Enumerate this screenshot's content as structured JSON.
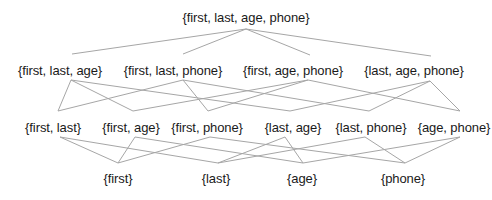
{
  "diagram": {
    "type": "hasse-diagram",
    "title": "",
    "levels": [
      {
        "name": "level-4",
        "nodes": [
          {
            "id": "flap",
            "label": "{first, last, age, phone}",
            "x": 246,
            "y": 10
          }
        ]
      },
      {
        "name": "level-3",
        "nodes": [
          {
            "id": "fla",
            "label": "{first, last, age}",
            "x": 60,
            "y": 63
          },
          {
            "id": "flp",
            "label": "{first, last, phone}",
            "x": 173,
            "y": 63
          },
          {
            "id": "fap",
            "label": "{first, age, phone}",
            "x": 293,
            "y": 63
          },
          {
            "id": "lap",
            "label": "{last, age, phone}",
            "x": 414,
            "y": 63
          }
        ]
      },
      {
        "name": "level-2",
        "nodes": [
          {
            "id": "fl",
            "label": "{first, last}",
            "x": 53,
            "y": 120
          },
          {
            "id": "fa",
            "label": "{first, age}",
            "x": 131,
            "y": 120
          },
          {
            "id": "fp",
            "label": "{first, phone}",
            "x": 207,
            "y": 120
          },
          {
            "id": "la",
            "label": "{last, age}",
            "x": 293,
            "y": 120
          },
          {
            "id": "lp",
            "label": "{last, phone}",
            "x": 371,
            "y": 120
          },
          {
            "id": "ap",
            "label": "{age, phone}",
            "x": 454,
            "y": 120
          }
        ]
      },
      {
        "name": "level-1",
        "nodes": [
          {
            "id": "f",
            "label": "{first}",
            "x": 118,
            "y": 171
          },
          {
            "id": "l",
            "label": "{last}",
            "x": 216,
            "y": 171
          },
          {
            "id": "a",
            "label": "{age}",
            "x": 302,
            "y": 171
          },
          {
            "id": "p",
            "label": "{phone}",
            "x": 403,
            "y": 171
          }
        ]
      }
    ],
    "edges": [
      {
        "from": "flap",
        "to": "fla",
        "x1": 246,
        "y1": 29,
        "x2": 72,
        "y2": 54
      },
      {
        "from": "flap",
        "to": "flp",
        "x1": 246,
        "y1": 29,
        "x2": 183,
        "y2": 54
      },
      {
        "from": "flap",
        "to": "fap",
        "x1": 246,
        "y1": 29,
        "x2": 310,
        "y2": 55
      },
      {
        "from": "flap",
        "to": "lap",
        "x1": 246,
        "y1": 29,
        "x2": 431,
        "y2": 56
      },
      {
        "from": "fla",
        "to": "fl",
        "x1": 71,
        "y1": 80,
        "x2": 58,
        "y2": 111
      },
      {
        "from": "fla",
        "to": "fa",
        "x1": 71,
        "y1": 80,
        "x2": 133,
        "y2": 111
      },
      {
        "from": "fla",
        "to": "la",
        "x1": 71,
        "y1": 80,
        "x2": 290,
        "y2": 111
      },
      {
        "from": "flp",
        "to": "fl",
        "x1": 183,
        "y1": 80,
        "x2": 58,
        "y2": 111
      },
      {
        "from": "flp",
        "to": "fp",
        "x1": 183,
        "y1": 80,
        "x2": 208,
        "y2": 111
      },
      {
        "from": "flp",
        "to": "lp",
        "x1": 183,
        "y1": 80,
        "x2": 369,
        "y2": 111
      },
      {
        "from": "fap",
        "to": "fa",
        "x1": 308,
        "y1": 80,
        "x2": 133,
        "y2": 111
      },
      {
        "from": "fap",
        "to": "fp",
        "x1": 308,
        "y1": 80,
        "x2": 208,
        "y2": 111
      },
      {
        "from": "fap",
        "to": "ap",
        "x1": 308,
        "y1": 80,
        "x2": 460,
        "y2": 111
      },
      {
        "from": "lap",
        "to": "la",
        "x1": 430,
        "y1": 81,
        "x2": 290,
        "y2": 111
      },
      {
        "from": "lap",
        "to": "lp",
        "x1": 430,
        "y1": 81,
        "x2": 369,
        "y2": 111
      },
      {
        "from": "lap",
        "to": "ap",
        "x1": 430,
        "y1": 81,
        "x2": 460,
        "y2": 111
      },
      {
        "from": "fl",
        "to": "f",
        "x1": 60,
        "y1": 137,
        "x2": 118,
        "y2": 163
      },
      {
        "from": "fl",
        "to": "l",
        "x1": 60,
        "y1": 137,
        "x2": 218,
        "y2": 163
      },
      {
        "from": "fa",
        "to": "f",
        "x1": 135,
        "y1": 137,
        "x2": 118,
        "y2": 163
      },
      {
        "from": "fa",
        "to": "a",
        "x1": 135,
        "y1": 137,
        "x2": 303,
        "y2": 163
      },
      {
        "from": "fp",
        "to": "f",
        "x1": 210,
        "y1": 137,
        "x2": 118,
        "y2": 163
      },
      {
        "from": "fp",
        "to": "p",
        "x1": 210,
        "y1": 137,
        "x2": 405,
        "y2": 163
      },
      {
        "from": "la",
        "to": "l",
        "x1": 285,
        "y1": 137,
        "x2": 218,
        "y2": 163
      },
      {
        "from": "la",
        "to": "a",
        "x1": 285,
        "y1": 137,
        "x2": 303,
        "y2": 163
      },
      {
        "from": "lp",
        "to": "l",
        "x1": 365,
        "y1": 137,
        "x2": 218,
        "y2": 163
      },
      {
        "from": "lp",
        "to": "p",
        "x1": 365,
        "y1": 137,
        "x2": 405,
        "y2": 163
      },
      {
        "from": "ap",
        "to": "a",
        "x1": 460,
        "y1": 137,
        "x2": 303,
        "y2": 163
      },
      {
        "from": "ap",
        "to": "p",
        "x1": 460,
        "y1": 137,
        "x2": 405,
        "y2": 163
      }
    ],
    "colors": {
      "edge": "#a6a6a6",
      "text": "#1a1a1a",
      "background": "#ffffff"
    }
  }
}
